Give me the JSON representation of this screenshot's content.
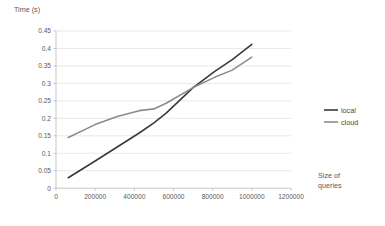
{
  "chart_data": {
    "type": "line",
    "title": "",
    "xlabel": "Size of queries",
    "ylabel": "Time (s)",
    "xlim": [
      0,
      1200000
    ],
    "ylim": [
      0,
      0.45
    ],
    "grid": true,
    "legend_position": "right",
    "x_ticks": [
      0,
      200000,
      400000,
      600000,
      800000,
      1000000,
      1200000
    ],
    "x_tick_labels": [
      "0",
      "200000",
      "400000",
      "600000",
      "800000",
      "1000000",
      "1200000"
    ],
    "y_ticks": [
      0,
      0.05,
      0.1,
      0.15,
      0.2,
      0.25,
      0.3,
      0.35,
      0.4,
      0.45
    ],
    "y_tick_labels": [
      "0",
      "0.05",
      "0.1",
      "0.15",
      "0.2",
      "0.25",
      "0.3",
      "0.35",
      "0.4",
      "0.45"
    ],
    "x": [
      62500,
      200000,
      312500,
      425000,
      500000,
      562500,
      700000,
      812500,
      900000,
      1000000
    ],
    "series": [
      {
        "name": "local",
        "color": "#3a3a3a",
        "x": [
          62500,
          200000,
          312500,
          425000,
          500000,
          562500,
          700000,
          812500,
          900000,
          1000000
        ],
        "values": [
          0.03,
          0.078,
          0.118,
          0.158,
          0.187,
          0.215,
          0.288,
          0.335,
          0.368,
          0.412
        ]
      },
      {
        "name": "cloud",
        "color": "#8c8c8c",
        "x": [
          62500,
          200000,
          312500,
          425000,
          500000,
          562500,
          700000,
          812500,
          900000,
          1000000
        ],
        "values": [
          0.145,
          0.182,
          0.205,
          0.222,
          0.227,
          0.243,
          0.288,
          0.318,
          0.338,
          0.375
        ]
      }
    ]
  },
  "legend": {
    "items": [
      {
        "label": "local"
      },
      {
        "label": "cloud"
      }
    ]
  },
  "axis": {
    "y_title": "Time (s)",
    "x_title_line1": "Size of",
    "x_title_line2": "queries"
  }
}
